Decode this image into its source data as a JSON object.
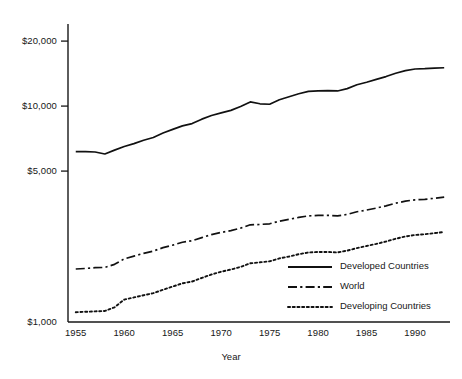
{
  "chart_data": {
    "type": "line",
    "title": "",
    "subtitle": "",
    "xlabel": "Year",
    "ylabel": "",
    "yscale": "log",
    "ylim": [
      1000,
      24000
    ],
    "xlim": [
      1954.2,
      1993.6
    ],
    "grid": false,
    "legend_position": "bottom-right",
    "y_tick_labels": [
      "$20,000",
      "$10,000",
      "$5,000",
      "$1,000"
    ],
    "y_tick_values": [
      20000,
      10000,
      5000,
      1000
    ],
    "x_tick_labels": [
      "1955",
      "1960",
      "1965",
      "1970",
      "1975",
      "1980",
      "1985",
      "1990"
    ],
    "x_tick_values": [
      1955,
      1960,
      1965,
      1970,
      1975,
      1980,
      1985,
      1990
    ],
    "x": [
      1955,
      1956,
      1957,
      1958,
      1959,
      1960,
      1961,
      1962,
      1963,
      1964,
      1965,
      1966,
      1967,
      1968,
      1969,
      1970,
      1971,
      1972,
      1973,
      1974,
      1975,
      1976,
      1977,
      1978,
      1979,
      1980,
      1981,
      1982,
      1983,
      1984,
      1985,
      1986,
      1987,
      1988,
      1989,
      1990,
      1991,
      1992,
      1993
    ],
    "series": [
      {
        "name": "Developed Countries",
        "style": "solid",
        "color": "#111111",
        "values": [
          6150,
          6150,
          6130,
          6000,
          6250,
          6500,
          6700,
          6950,
          7150,
          7500,
          7800,
          8100,
          8300,
          8700,
          9050,
          9300,
          9550,
          9950,
          10450,
          10250,
          10200,
          10700,
          11050,
          11400,
          11700,
          11750,
          11800,
          11750,
          12050,
          12550,
          12900,
          13300,
          13700,
          14200,
          14600,
          14850,
          14900,
          15000,
          15050
        ]
      },
      {
        "name": "World",
        "style": "dash-dot",
        "color": "#111111",
        "values": [
          1760,
          1770,
          1785,
          1790,
          1850,
          1960,
          2020,
          2080,
          2130,
          2210,
          2270,
          2340,
          2380,
          2460,
          2540,
          2600,
          2650,
          2720,
          2820,
          2830,
          2850,
          2930,
          2990,
          3050,
          3100,
          3120,
          3120,
          3100,
          3150,
          3240,
          3300,
          3370,
          3450,
          3550,
          3630,
          3680,
          3700,
          3740,
          3790
        ]
      },
      {
        "name": "Developing Countries",
        "style": "dotted",
        "color": "#111111",
        "values": [
          1110,
          1115,
          1120,
          1125,
          1170,
          1270,
          1300,
          1330,
          1360,
          1410,
          1460,
          1510,
          1540,
          1600,
          1660,
          1710,
          1750,
          1800,
          1870,
          1890,
          1910,
          1970,
          2010,
          2060,
          2100,
          2110,
          2110,
          2100,
          2140,
          2200,
          2250,
          2300,
          2360,
          2430,
          2490,
          2530,
          2550,
          2580,
          2610
        ]
      }
    ]
  },
  "legend": {
    "items": [
      {
        "label": "Developed Countries",
        "style": "solid"
      },
      {
        "label": "World",
        "style": "dash-dot"
      },
      {
        "label": "Developing Countries",
        "style": "dotted"
      }
    ]
  },
  "axes": {
    "x_title": "Year"
  }
}
